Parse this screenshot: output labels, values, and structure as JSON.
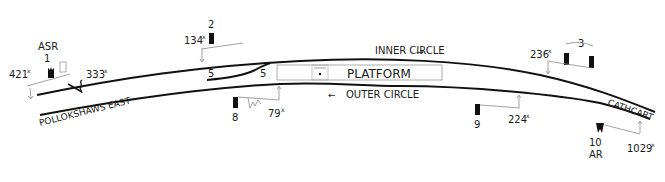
{
  "diagram": {
    "type": "railway-signalling-layout",
    "station": "Pollokshaws East",
    "locations": {
      "west": "POLLOKSHAWS EAST",
      "east": "CATHCART"
    },
    "platform_label": "PLATFORM",
    "directions": {
      "inner": "INNER CIRCLE",
      "outer": "OUTER CIRCLE"
    },
    "points_labels": [
      "5",
      "5"
    ],
    "signals": [
      {
        "id": "1",
        "label": "1",
        "annotation": "ASR",
        "distance": "421",
        "distance_sup": "x"
      },
      {
        "id": "2",
        "label": "2",
        "distance": "134",
        "distance_sup": "x"
      },
      {
        "id": "3",
        "label": "3",
        "distance": "236",
        "distance_sup": "x"
      },
      {
        "id": "8",
        "label": "8",
        "distance": "79",
        "distance_sup": "x"
      },
      {
        "id": "9",
        "label": "9",
        "distance": "224",
        "distance_sup": "x"
      },
      {
        "id": "10",
        "label": "10",
        "annotation": "AR",
        "distance": "1029",
        "distance_sup": "x"
      }
    ],
    "crossing": {
      "distance": "333",
      "distance_sup": "x"
    }
  }
}
